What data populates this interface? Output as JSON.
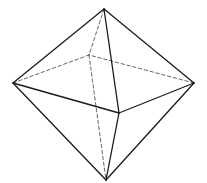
{
  "diagram": {
    "type": "octahedron",
    "stroke_color": "#1a1a1a",
    "hidden_stroke_color": "#555555",
    "vertices": {
      "top": [
        104,
        9
      ],
      "left": [
        13,
        83
      ],
      "right": [
        194,
        83
      ],
      "front": [
        119,
        113
      ],
      "back": [
        89,
        55
      ],
      "bottom": [
        106,
        180
      ]
    },
    "visible_edges": [
      [
        "top",
        "left"
      ],
      [
        "top",
        "right"
      ],
      [
        "top",
        "front"
      ],
      [
        "left",
        "front"
      ],
      [
        "right",
        "front"
      ],
      [
        "left",
        "bottom"
      ],
      [
        "right",
        "bottom"
      ],
      [
        "front",
        "bottom"
      ]
    ],
    "hidden_edges": [
      [
        "top",
        "back"
      ],
      [
        "left",
        "back"
      ],
      [
        "right",
        "back"
      ],
      [
        "back",
        "bottom"
      ]
    ]
  }
}
